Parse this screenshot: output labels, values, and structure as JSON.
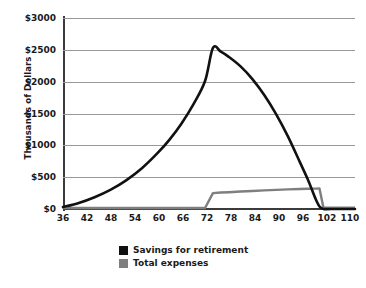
{
  "chart_data": {
    "type": "line",
    "title": "",
    "xlabel": "",
    "ylabel": "Thousands of Dollars",
    "xlim": [
      36,
      110
    ],
    "ylim": [
      0,
      3000
    ],
    "grid": true,
    "legend_position": "bottom-center",
    "xticks": [
      36,
      42,
      48,
      54,
      60,
      66,
      72,
      78,
      84,
      90,
      96,
      102,
      110
    ],
    "xtick_labels": [
      "36",
      "42",
      "48",
      "54",
      "60",
      "66",
      "72",
      "78",
      "84",
      "90",
      "96",
      "102",
      "110"
    ],
    "yticks": [
      0,
      500,
      1000,
      1500,
      2000,
      2500,
      3000
    ],
    "ytick_labels": [
      "$0",
      "$500",
      "$1000",
      "$1500",
      "$2000",
      "$2500",
      "$3000"
    ],
    "x": [
      36,
      40,
      44,
      48,
      52,
      56,
      60,
      63,
      66,
      69,
      72,
      74,
      76,
      78,
      81,
      84,
      87,
      90,
      93,
      96,
      98,
      100,
      101,
      102,
      104,
      110
    ],
    "series": [
      {
        "name": "Savings for retirement",
        "color": "#111111",
        "values": [
          30,
          95,
          185,
          300,
          450,
          640,
          880,
          1090,
          1340,
          1640,
          2010,
          2530,
          2470,
          2390,
          2240,
          2040,
          1790,
          1490,
          1140,
          740,
          470,
          160,
          40,
          0,
          0,
          0
        ]
      },
      {
        "name": "Total expenses",
        "color": "#7f7f7f",
        "values": [
          15,
          15,
          15,
          15,
          15,
          15,
          15,
          15,
          15,
          15,
          15,
          250,
          258,
          264,
          274,
          283,
          292,
          300,
          308,
          315,
          318,
          320,
          322,
          20,
          20,
          20
        ]
      }
    ],
    "annotations": {
      "peak_age": 74,
      "peak_value": 2530,
      "expenses_step_age": 73,
      "expenses_step_value": 250,
      "savings_depleted_age": 102
    }
  },
  "legend": {
    "items": [
      {
        "label": "Savings for retirement",
        "color": "#111111"
      },
      {
        "label": "Total expenses",
        "color": "#7f7f7f"
      }
    ]
  }
}
